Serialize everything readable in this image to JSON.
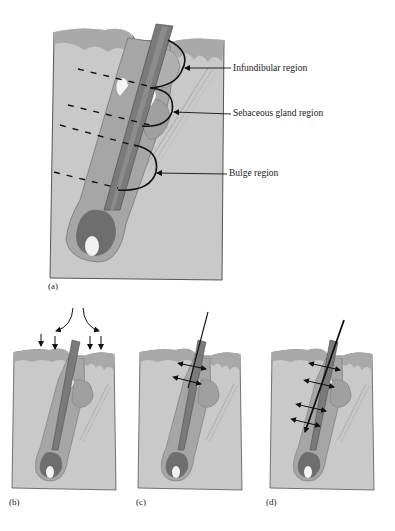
{
  "figure": {
    "panel_a": {
      "label": "(a)",
      "annotations": [
        {
          "text": "Infundibular region"
        },
        {
          "text": "Sebaceous gland region"
        },
        {
          "text": "Bulge region"
        }
      ]
    },
    "panel_b": {
      "label": "(b)"
    },
    "panel_c": {
      "label": "(c)"
    },
    "panel_d": {
      "label": "(d)"
    }
  },
  "colors": {
    "dermis": "#c9c9c9",
    "epidermis": "#a9a9a9",
    "follicle_sheath": "#a6a6a6",
    "hair_shaft": "#7a7a7a",
    "bulb": "#6e6e6e",
    "papilla": "#f2f2f2",
    "ink": "#111111"
  }
}
